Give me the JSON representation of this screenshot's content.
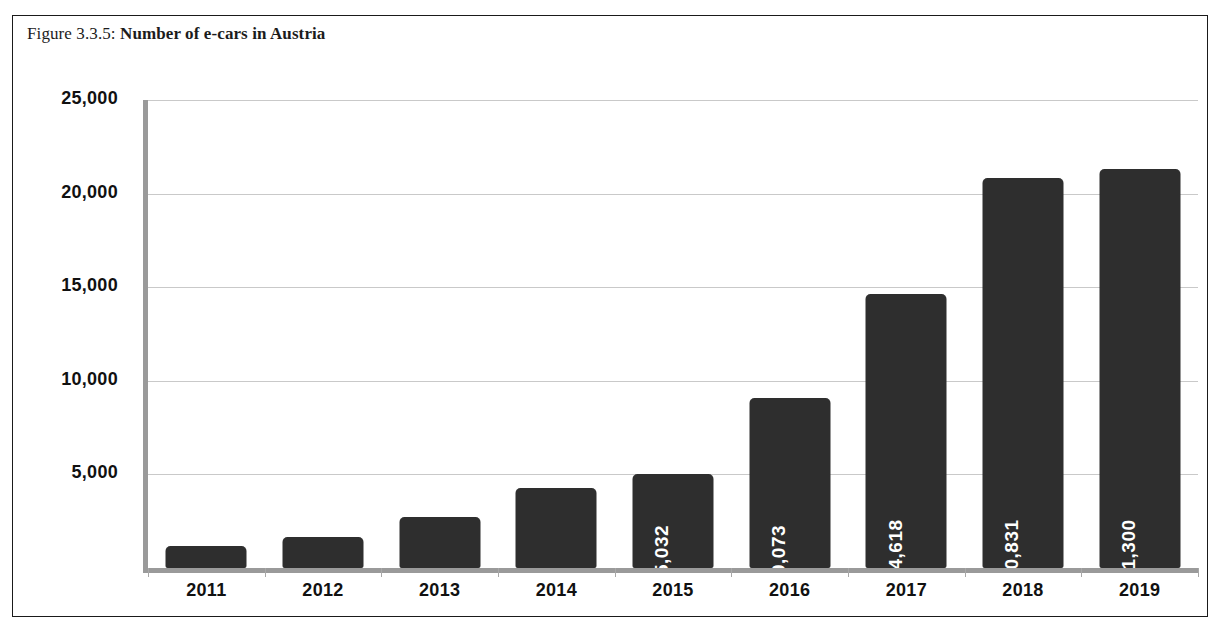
{
  "figure": {
    "number": "Figure 3.3.5:",
    "title": "Number of e-cars in Austria"
  },
  "chart_data": {
    "type": "bar",
    "title": "Number of e-cars in Austria",
    "xlabel": "",
    "ylabel": "",
    "categories": [
      "2011",
      "2012",
      "2013",
      "2014",
      "2015",
      "2016",
      "2017",
      "2018",
      "2019"
    ],
    "values": [
      1160,
      1660,
      2700,
      4250,
      5032,
      9073,
      14618,
      20831,
      21300
    ],
    "value_labels": [
      "",
      "",
      "",
      "",
      "5,032",
      "9,073",
      "14,618",
      "20,831",
      "21,300"
    ],
    "ylim": [
      0,
      25000
    ],
    "yticks": [
      5000,
      10000,
      15000,
      20000,
      25000
    ],
    "ytick_labels": [
      "5,000",
      "10,000",
      "15,000",
      "20,000",
      "25,000"
    ],
    "grid": true,
    "legend": "none",
    "bar_color": "#2e2e2e",
    "label_color": "#ffffff",
    "gridline_color": "#c9c9c9",
    "axis_color": "#9a9a9a",
    "background": "#ffffff"
  }
}
